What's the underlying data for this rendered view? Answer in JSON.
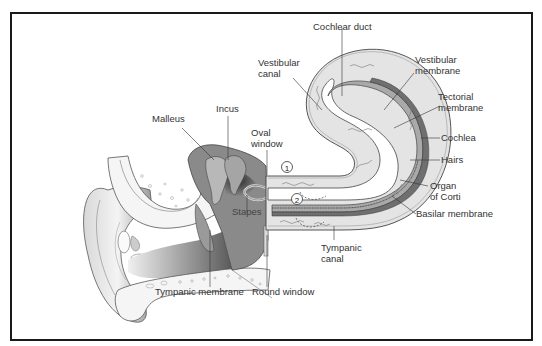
{
  "diagram": {
    "colors": {
      "border": "#1a1a1a",
      "label": "#333333",
      "fluid": "#e6e6e6",
      "duct": "#a9a9a9",
      "dark_membrane": "#6f6f6f",
      "bone": "#f2f2f2",
      "shadow": "#4a4a4a"
    },
    "labels": {
      "cochlear_duct": "Cochlear duct",
      "vestibular_canal_1": "Vestibular",
      "vestibular_canal_2": "canal",
      "vestibular_membrane_1": "Vestibular",
      "vestibular_membrane_2": "membrane",
      "tectorial_membrane_1": "Tectorial",
      "tectorial_membrane_2": "membrane",
      "cochlea": "Cochlea",
      "hairs": "Hairs",
      "organ_of_corti_1": "Organ",
      "organ_of_corti_2": "of Corti",
      "basilar_membrane": "Basilar membrane",
      "tympanic_canal_1": "Tympanic",
      "tympanic_canal_2": "canal",
      "malleus": "Malleus",
      "incus": "Incus",
      "oval_window_1": "Oval",
      "oval_window_2": "window",
      "stapes": "Stapes",
      "tympanic_membrane": "Tympanic membrane",
      "round_window": "Round window"
    },
    "markers": {
      "step1": "1",
      "step2": "2"
    }
  }
}
